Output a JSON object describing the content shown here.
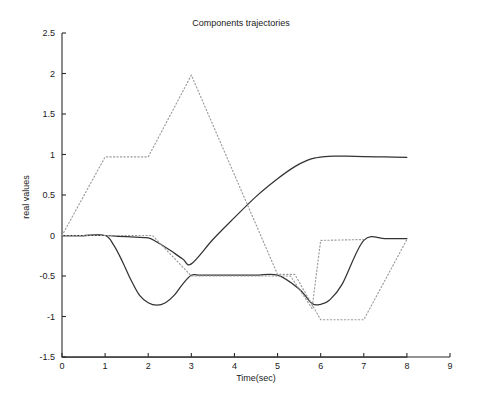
{
  "chart_data": {
    "type": "line",
    "title": "Components trajectories",
    "xlabel": "Time(sec)",
    "ylabel": "real values",
    "xlim": [
      0,
      9
    ],
    "ylim": [
      -1.5,
      2.5
    ],
    "xticks": [
      "0",
      "1",
      "2",
      "3",
      "4",
      "5",
      "6",
      "7",
      "8",
      "9"
    ],
    "xtick_values": [
      0,
      1,
      2,
      3,
      4,
      5,
      6,
      7,
      8,
      9
    ],
    "yticks": [
      "2.5",
      "2",
      "1.5",
      "1",
      "0.5",
      "0",
      "-0.5",
      "-1",
      "-1.5"
    ],
    "ytick_values": [
      2.5,
      2,
      1.5,
      1,
      0.5,
      0,
      -0.5,
      -1,
      -1.5
    ],
    "grid": false,
    "legend": "none",
    "series": [
      {
        "name": "component-1-solid",
        "style": "solid",
        "color": "#333333",
        "x": [
          0.0,
          0.5,
          1.0,
          1.2,
          1.4,
          1.6,
          1.8,
          2.0,
          2.2,
          2.4,
          2.6,
          2.8,
          3.0,
          3.2,
          3.5,
          4.0,
          4.5,
          5.0,
          5.5,
          5.8,
          6.0,
          6.2,
          6.5,
          7.0,
          7.5,
          8.0
        ],
        "y": [
          0.0,
          0.0,
          0.0,
          -0.12,
          -0.32,
          -0.55,
          -0.74,
          -0.83,
          -0.86,
          -0.83,
          -0.74,
          -0.6,
          -0.49,
          -0.49,
          -0.49,
          -0.49,
          -0.49,
          -0.49,
          -0.66,
          -0.84,
          -0.85,
          -0.8,
          -0.6,
          -0.06,
          -0.04,
          -0.04
        ]
      },
      {
        "name": "component-2-solid",
        "style": "solid",
        "color": "#333333",
        "x": [
          0.0,
          0.5,
          1.0,
          1.3,
          1.7,
          2.0,
          2.2,
          2.5,
          2.8,
          3.0,
          3.5,
          4.0,
          4.5,
          5.0,
          5.4,
          5.7,
          5.9,
          6.1,
          6.3,
          6.6,
          7.0,
          7.5,
          8.0
        ],
        "y": [
          0.0,
          0.0,
          0.0,
          -0.01,
          -0.02,
          -0.03,
          -0.08,
          -0.18,
          -0.29,
          -0.35,
          -0.05,
          0.22,
          0.48,
          0.7,
          0.85,
          0.93,
          0.96,
          0.975,
          0.98,
          0.98,
          0.975,
          0.97,
          0.965
        ]
      },
      {
        "name": "component-3-solid-baseline",
        "style": "solid",
        "color": "#333333",
        "x": [
          0.0,
          8.0
        ],
        "y": [
          -1.5,
          -1.5
        ]
      },
      {
        "name": "component-1-dotted",
        "style": "dotted",
        "color": "#9a9a9a",
        "x": [
          0.0,
          1.0,
          2.0,
          3.0,
          5.0,
          5.4,
          6.0,
          7.0,
          8.0
        ],
        "y": [
          0.0,
          0.97,
          0.97,
          1.98,
          -0.48,
          -0.48,
          -1.04,
          -1.04,
          -0.05
        ]
      },
      {
        "name": "component-2-dotted",
        "style": "dotted",
        "color": "#9a9a9a",
        "x": [
          0.0,
          2.1,
          3.0,
          5.3,
          5.8,
          6.0,
          7.0
        ],
        "y": [
          0.0,
          0.0,
          -0.5,
          -0.5,
          -0.9,
          -0.06,
          -0.05
        ]
      }
    ]
  },
  "plot_geometry": {
    "left": 62,
    "right": 450,
    "top": 33,
    "bottom": 357
  }
}
